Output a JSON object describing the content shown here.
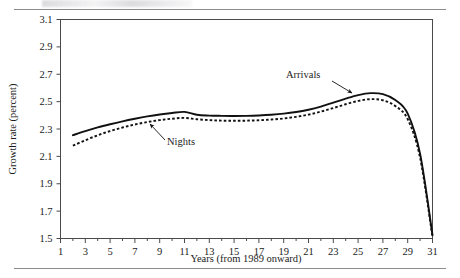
{
  "figure": {
    "caption_partial": "",
    "background": "#ffffff",
    "rule_color": "#8c8c8c"
  },
  "chart_data": {
    "type": "line",
    "title": "",
    "xlabel": "Years (from 1989 onward)",
    "ylabel": "Growth rate (percent)",
    "xlim": [
      1,
      31
    ],
    "ylim": [
      1.5,
      3.1
    ],
    "xticks": [
      1,
      3,
      5,
      7,
      9,
      11,
      13,
      15,
      17,
      19,
      21,
      23,
      25,
      27,
      29,
      31
    ],
    "xtick_labels": [
      "1",
      "3",
      "5",
      "7",
      "9",
      "11",
      "13",
      "15",
      "17",
      "19",
      "21",
      "23",
      "25",
      "27",
      "29",
      "31"
    ],
    "yticks": [
      1.5,
      1.7,
      1.9,
      2.1,
      2.3,
      2.5,
      2.7,
      2.9,
      3.1
    ],
    "ytick_labels": [
      "1.5",
      "1.7",
      "1.9",
      "2.1",
      "2.3",
      "2.5",
      "2.7",
      "2.9",
      "3.1"
    ],
    "grid": false,
    "legend_position": "inline-annotation",
    "x": [
      2,
      3,
      4,
      5,
      6,
      7,
      8,
      9,
      10,
      11,
      12,
      13,
      14,
      15,
      16,
      17,
      18,
      19,
      20,
      21,
      22,
      23,
      24,
      25,
      26,
      27,
      28,
      29,
      30,
      31
    ],
    "series": [
      {
        "name": "Arrivals",
        "style": "solid",
        "color": "#111111",
        "values": [
          2.255,
          2.285,
          2.312,
          2.335,
          2.356,
          2.375,
          2.392,
          2.406,
          2.417,
          2.425,
          2.404,
          2.398,
          2.396,
          2.395,
          2.396,
          2.399,
          2.404,
          2.412,
          2.424,
          2.441,
          2.464,
          2.492,
          2.522,
          2.548,
          2.562,
          2.555,
          2.512,
          2.412,
          2.118,
          1.525
        ]
      },
      {
        "name": "Nights",
        "style": "dashed",
        "color": "#111111",
        "values": [
          2.178,
          2.218,
          2.254,
          2.285,
          2.311,
          2.333,
          2.351,
          2.365,
          2.375,
          2.381,
          2.371,
          2.365,
          2.361,
          2.36,
          2.361,
          2.364,
          2.369,
          2.377,
          2.389,
          2.405,
          2.427,
          2.453,
          2.481,
          2.505,
          2.518,
          2.51,
          2.468,
          2.372,
          2.09,
          1.512
        ]
      }
    ],
    "annotations": [
      {
        "text": "Arrivals",
        "target_series": "Arrivals",
        "label_x_px": 286,
        "label_y_px": 78,
        "arrow_from_px": [
          332,
          81
        ],
        "arrow_to_px": [
          352,
          93
        ]
      },
      {
        "text": "Nights",
        "target_series": "Nights",
        "label_x_px": 167,
        "label_y_px": 145,
        "arrow_from_px": [
          165,
          140
        ],
        "arrow_to_px": [
          150,
          124
        ]
      }
    ]
  }
}
